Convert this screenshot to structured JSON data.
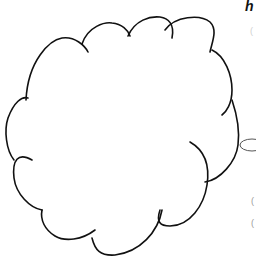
{
  "illustration": {
    "subject": "cloud thought bubble",
    "stroke_color": "#111111",
    "fill_color": "#ffffff",
    "small_bubble_stroke_color": "#555555"
  },
  "corner_text": {
    "visible_glyph": "h"
  },
  "faint_marks": [
    "(",
    "(",
    "("
  ]
}
